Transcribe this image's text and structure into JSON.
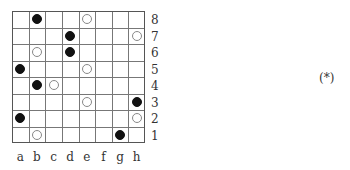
{
  "diagram": {
    "files": [
      "a",
      "b",
      "c",
      "d",
      "e",
      "f",
      "g",
      "h"
    ],
    "ranks": [
      "8",
      "7",
      "6",
      "5",
      "4",
      "3",
      "2",
      "1"
    ],
    "stones": [
      {
        "square": "b8",
        "color": "black"
      },
      {
        "square": "e8",
        "color": "white"
      },
      {
        "square": "d7",
        "color": "black"
      },
      {
        "square": "h7",
        "color": "white"
      },
      {
        "square": "b6",
        "color": "white"
      },
      {
        "square": "d6",
        "color": "black"
      },
      {
        "square": "a5",
        "color": "black"
      },
      {
        "square": "e5",
        "color": "white"
      },
      {
        "square": "b4",
        "color": "black"
      },
      {
        "square": "c4",
        "color": "white"
      },
      {
        "square": "e3",
        "color": "white"
      },
      {
        "square": "h3",
        "color": "black"
      },
      {
        "square": "a2",
        "color": "black"
      },
      {
        "square": "h2",
        "color": "white"
      },
      {
        "square": "b1",
        "color": "white"
      },
      {
        "square": "g1",
        "color": "black"
      }
    ],
    "tag": "(*)"
  }
}
